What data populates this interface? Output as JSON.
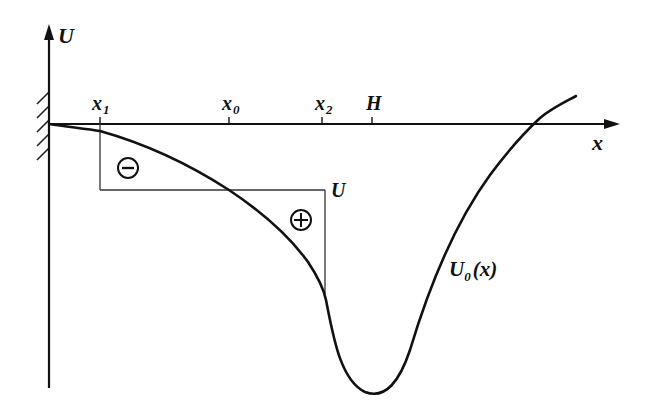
{
  "diagram": {
    "type": "potential-well-sketch",
    "colors": {
      "ink": "#111111",
      "thin_ink": "#333333",
      "background": "#ffffff"
    },
    "axes": {
      "y_label": "U",
      "x_label": "x",
      "wall": "hatched-wall-at-origin"
    },
    "ticks": [
      {
        "id": "x1",
        "base": "x",
        "sub": "1",
        "px": 100
      },
      {
        "id": "x0",
        "base": "x",
        "sub": "0",
        "px": 229
      },
      {
        "id": "x2",
        "base": "x",
        "sub": "2",
        "px": 322
      },
      {
        "id": "H",
        "base": "H",
        "sub": "",
        "px": 372
      }
    ],
    "energy_level": {
      "label": "U"
    },
    "curve": {
      "label_base": "U",
      "label_sub": "0",
      "label_arg": "(x)"
    },
    "regions": [
      {
        "id": "minus",
        "sign": "−",
        "meaning": "area below energy level between x1 and x0"
      },
      {
        "id": "plus",
        "sign": "+",
        "meaning": "area above curve between x0 and x2"
      }
    ]
  }
}
